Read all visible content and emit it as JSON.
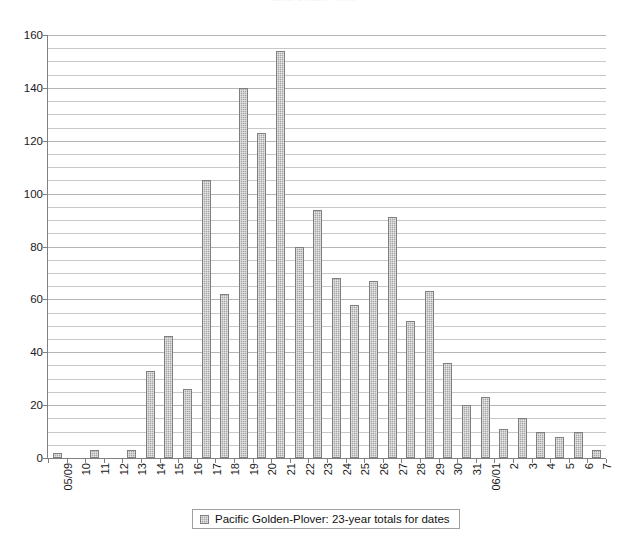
{
  "clipped_title": "Pacific Golden-Plover",
  "legend": {
    "entries": [
      {
        "label": "Pacific Golden-Plover: 23-year totals for dates",
        "color": "#a6a6a6"
      }
    ]
  },
  "axes": {
    "y_tick_labels": [
      "160",
      "140",
      "120",
      "100",
      "80",
      "60",
      "40",
      "20",
      "0"
    ],
    "y_min": 0,
    "y_max": 160,
    "y_major_step": 20,
    "y_minor_step": 5,
    "grid": "horizontal"
  },
  "chart_data": {
    "type": "bar",
    "title": "Pacific Golden-Plover: 23-year totals for dates",
    "xlabel": "",
    "ylabel": "",
    "ylim": [
      0,
      160
    ],
    "grid": true,
    "legend_position": "bottom",
    "bar_color": "#a6a6a6",
    "categories": [
      "05/09",
      "10",
      "11",
      "12",
      "13",
      "14",
      "15",
      "16",
      "17",
      "18",
      "19",
      "20",
      "21",
      "22",
      "23",
      "24",
      "25",
      "26",
      "27",
      "28",
      "29",
      "30",
      "31",
      "06/01",
      "2",
      "3",
      "4",
      "5",
      "6",
      "7"
    ],
    "values": [
      2,
      0,
      3,
      0,
      3,
      33,
      46,
      26,
      105,
      62,
      140,
      123,
      154,
      80,
      94,
      68,
      58,
      67,
      91,
      52,
      63,
      36,
      20,
      23,
      11,
      15,
      10,
      8,
      10,
      3
    ],
    "series": [
      {
        "name": "Pacific Golden-Plover: 23-year totals for dates",
        "values": [
          2,
          0,
          3,
          0,
          3,
          33,
          46,
          26,
          105,
          62,
          140,
          123,
          154,
          80,
          94,
          68,
          58,
          67,
          91,
          52,
          63,
          36,
          20,
          23,
          11,
          15,
          10,
          8,
          10,
          3
        ]
      }
    ]
  }
}
